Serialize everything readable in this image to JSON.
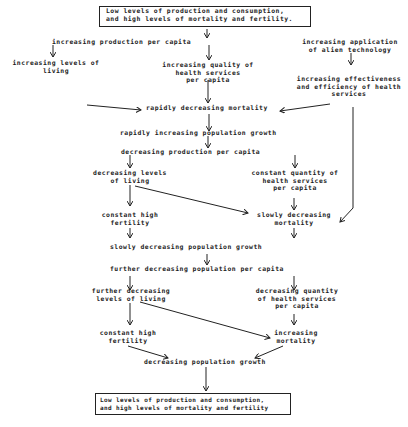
{
  "diagram": {
    "top_box": {
      "line1": "Low levels of production and consumption,",
      "line2": "and high levels of mortality and fertility."
    },
    "nodes": {
      "inc_prod": "increasing production per capita",
      "inc_alien": [
        "increasing application",
        "of alien technology"
      ],
      "inc_levels": [
        "increasing levels of",
        "living"
      ],
      "inc_quality": [
        "increasing quality of",
        "health services",
        "per capita"
      ],
      "inc_effect": [
        "increasing effectiveness",
        "and efficiency of health",
        "services"
      ],
      "rapid_dec_mort": "rapidly decreasing mortality",
      "rapid_inc_pop": "rapidly increasing population growth",
      "dec_prod": "decreasing production per capita",
      "dec_levels": [
        "decreasing levels",
        "of living"
      ],
      "const_qty": [
        "constant quantity of",
        "health services",
        "per capita"
      ],
      "const_fert1": [
        "constant high",
        "fertility"
      ],
      "slow_dec_mort": [
        "slowly decreasing",
        "mortality"
      ],
      "slow_dec_pop": "slowly decreasing population growth",
      "further_dec_pop": "further decreasing population per capita",
      "further_dec_levels": [
        "further decreasing",
        "levels of living"
      ],
      "dec_qty": [
        "decreasing quantity",
        "of health services",
        "per capita"
      ],
      "const_fert2": [
        "constant high",
        "fertility"
      ],
      "inc_mort": [
        "increasing",
        "mortality"
      ],
      "dec_pop": "decreasing population growth"
    },
    "bottom_box": {
      "line1": "Low levels of production and consumption,",
      "line2": "and high levels of mortality and fertility"
    }
  }
}
